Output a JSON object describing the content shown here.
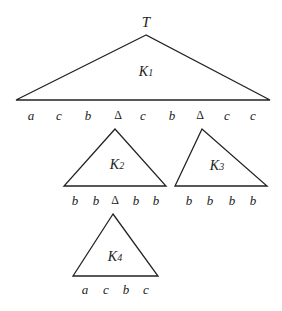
{
  "root_label": "T",
  "stroke_color": "#222222",
  "triangles": [
    {
      "id": "K1",
      "label_main": "K",
      "label_sub": "1",
      "apex": [
        146,
        35
      ],
      "base_left": [
        16,
        100
      ],
      "base_right": [
        270,
        100
      ],
      "label_pos": [
        146,
        72
      ],
      "leaves": [
        "a",
        "c",
        "b",
        "Δ",
        "c",
        "b",
        "Δ",
        "c",
        "c"
      ],
      "leaf_x": [
        31,
        59,
        88,
        118,
        143,
        172,
        200,
        227,
        253
      ],
      "leaf_y": 115
    },
    {
      "id": "K2",
      "label_main": "K",
      "label_sub": "2",
      "apex": [
        115,
        129
      ],
      "base_left": [
        64,
        186
      ],
      "base_right": [
        166,
        186
      ],
      "label_pos": [
        117,
        165
      ],
      "leaves": [
        "b",
        "b",
        "Δ",
        "b",
        "b"
      ],
      "leaf_x": [
        75,
        96,
        115,
        136,
        156
      ],
      "leaf_y": 200
    },
    {
      "id": "K3",
      "label_main": "K",
      "label_sub": "3",
      "apex": [
        202,
        129
      ],
      "base_left": [
        175,
        186
      ],
      "base_right": [
        267,
        186
      ],
      "label_pos": [
        217,
        166
      ],
      "leaves": [
        "b",
        "b",
        "b",
        "b"
      ],
      "leaf_x": [
        189,
        210,
        232,
        253
      ],
      "leaf_y": 200
    },
    {
      "id": "K4",
      "label_main": "K",
      "label_sub": "4",
      "apex": [
        113,
        214
      ],
      "base_left": [
        73,
        276
      ],
      "base_right": [
        158,
        276
      ],
      "label_pos": [
        115,
        257
      ],
      "leaves": [
        "a",
        "c",
        "b",
        "c"
      ],
      "leaf_x": [
        85,
        106,
        126,
        146
      ],
      "leaf_y": 289
    }
  ]
}
